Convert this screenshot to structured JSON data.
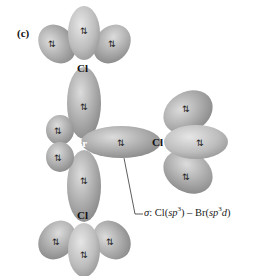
{
  "panel_label": "(c)",
  "atoms": {
    "cl_top": "Cl",
    "br_center": "Br",
    "cl_right": "Cl",
    "cl_bottom": "Cl"
  },
  "electron_pair_symbol": "⇅",
  "caption": {
    "sigma": "σ",
    "colon": ": Cl(",
    "sp": "sp",
    "sup3a": "3",
    "mid": ") – Br(",
    "sp2": "sp",
    "sup3b": "3",
    "d": "d",
    "close": ")"
  },
  "colors": {
    "lobe_dark": "#8f8f8f",
    "lobe_mid": "#b0b0b0",
    "lobe_light": "#d6d6d6",
    "text": "#111111"
  }
}
